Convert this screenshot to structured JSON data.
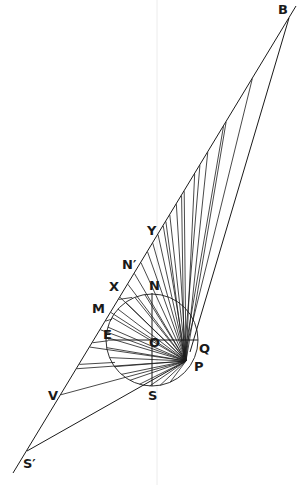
{
  "figure": {
    "type": "geometric-construction",
    "stroke_color": "#1a1a1a",
    "faint_color": "#e6e6e6",
    "background": "#ffffff"
  },
  "points": {
    "B": {
      "label": "B",
      "x": 289,
      "y": 18,
      "lx": 278,
      "ly": 2
    },
    "S_prime": {
      "label": "S′",
      "x": 27,
      "y": 451,
      "lx": 24,
      "ly": 456
    },
    "Y": {
      "label": "Y",
      "x": 155,
      "y": 237,
      "lx": 146,
      "ly": 224
    },
    "N_prime": {
      "label": "N′",
      "x": 135,
      "y": 266,
      "lx": 122,
      "ly": 258
    },
    "X": {
      "label": "X",
      "x": 119,
      "y": 290,
      "lx": 108,
      "ly": 280
    },
    "N": {
      "label": "N",
      "x": 155,
      "y": 293,
      "lx": 149,
      "ly": 279
    },
    "M": {
      "label": "M",
      "x": 109,
      "y": 307,
      "lx": 92,
      "ly": 302
    },
    "E": {
      "label": "E",
      "x": 108,
      "y": 333,
      "lx": 102,
      "ly": 327
    },
    "O": {
      "label": "O",
      "x": 152,
      "y": 340,
      "lx": 148,
      "ly": 336
    },
    "Q": {
      "label": "Q",
      "x": 197,
      "y": 343,
      "lx": 198,
      "ly": 342
    },
    "P": {
      "label": "P",
      "x": 186,
      "y": 361,
      "lx": 193,
      "ly": 359
    },
    "V": {
      "label": "V",
      "x": 63,
      "y": 395,
      "lx": 48,
      "ly": 390
    },
    "S": {
      "label": "S",
      "x": 152,
      "y": 386,
      "lx": 147,
      "ly": 389
    }
  },
  "circle": {
    "cx": 152,
    "cy": 340,
    "r": 46
  },
  "labels": [
    "B",
    "Y",
    "N′",
    "X",
    "N",
    "M",
    "E",
    "O",
    "Q",
    "P",
    "V",
    "S",
    "S′"
  ]
}
